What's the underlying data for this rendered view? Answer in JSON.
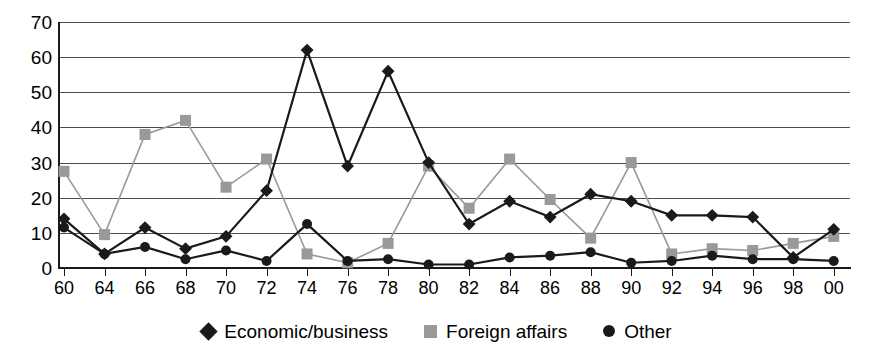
{
  "chart_data": {
    "type": "line",
    "title": "",
    "subtitle": "",
    "xlabel": "",
    "ylabel": "",
    "ylim": [
      0,
      70
    ],
    "yticks": [
      0,
      10,
      20,
      30,
      40,
      50,
      60,
      70
    ],
    "grid": true,
    "legend_position": "bottom",
    "categories": [
      "60",
      "64",
      "66",
      "68",
      "70",
      "72",
      "74",
      "76",
      "78",
      "80",
      "82",
      "84",
      "86",
      "88",
      "90",
      "92",
      "94",
      "96",
      "98",
      "00"
    ],
    "series": [
      {
        "name": "Economic/business",
        "marker": "diamond",
        "color": "#1a1a1a",
        "values": [
          14,
          4,
          11.5,
          5.5,
          9,
          22,
          62,
          29,
          56,
          30,
          12.5,
          19,
          14.5,
          21,
          19,
          15,
          15,
          14.5,
          3,
          11
        ]
      },
      {
        "name": "Foreign affairs",
        "marker": "square",
        "color": "#999999",
        "values": [
          27.5,
          9.5,
          38,
          42,
          23,
          31,
          4,
          1.5,
          7,
          29,
          17,
          31,
          19.5,
          8.5,
          30,
          4,
          5.5,
          5,
          7,
          9
        ]
      },
      {
        "name": "Other",
        "marker": "circle",
        "color": "#1a1a1a",
        "values": [
          11.5,
          4,
          6,
          2.5,
          5,
          2,
          12.5,
          2,
          2.5,
          1,
          1,
          3,
          3.5,
          4.5,
          1.5,
          2,
          3.5,
          2.5,
          2.5,
          2
        ]
      }
    ],
    "legend": [
      {
        "label": "Economic/business",
        "marker": "diamond",
        "color": "#1a1a1a"
      },
      {
        "label": "Foreign affairs",
        "marker": "square",
        "color": "#999999"
      },
      {
        "label": "Other",
        "marker": "circle",
        "color": "#1a1a1a"
      }
    ],
    "colors": {
      "axis": "#1a1a1a",
      "grid": "#4d4d4d",
      "background": "#ffffff",
      "economic": "#1a1a1a",
      "foreign": "#999999",
      "other": "#1a1a1a"
    }
  }
}
